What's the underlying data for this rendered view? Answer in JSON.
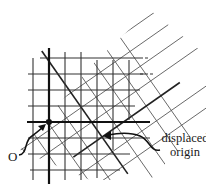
{
  "diagram": {
    "labels": {
      "origin": "O",
      "displaced_origin_line1": "displaced",
      "displaced_origin_line2": "origin"
    },
    "square_grid": {
      "x_lines": [
        33,
        49,
        65,
        81,
        97,
        113,
        129,
        145
      ],
      "y_lines": [
        58,
        74,
        90,
        106,
        122,
        138,
        154,
        170
      ],
      "axis_x": 49,
      "axis_y": 122,
      "spacing": 16
    },
    "rotated_grid": {
      "rotation_deg": -35,
      "origin": [
        102,
        137
      ],
      "spacing": 18
    },
    "points": {
      "origin": [
        49,
        122
      ],
      "displaced_origin": [
        102,
        137
      ]
    },
    "colors": {
      "line": "#222222",
      "thin_line": "#555555",
      "background": "#ffffff"
    }
  }
}
